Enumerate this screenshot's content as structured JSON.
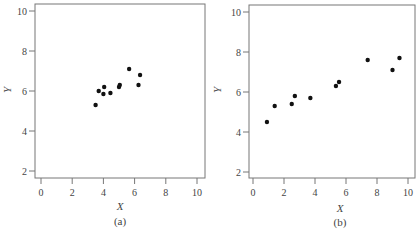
{
  "chart_data": [
    {
      "id": "a",
      "type": "scatter",
      "title": "",
      "caption": "(a)",
      "xlabel": "X",
      "ylabel": "Y",
      "xlim": [
        -0.5,
        10.5
      ],
      "ylim": [
        1.7,
        10.35
      ],
      "xticks": [
        0,
        2,
        4,
        6,
        8,
        10
      ],
      "yticks": [
        2,
        4,
        6,
        8,
        10
      ],
      "grid": false,
      "legend": null,
      "points": [
        {
          "x": 3.5,
          "y": 5.3
        },
        {
          "x": 3.7,
          "y": 6.0
        },
        {
          "x": 4.0,
          "y": 5.85
        },
        {
          "x": 4.05,
          "y": 6.2
        },
        {
          "x": 4.45,
          "y": 5.9
        },
        {
          "x": 5.0,
          "y": 6.2
        },
        {
          "x": 5.05,
          "y": 6.3
        },
        {
          "x": 5.65,
          "y": 7.1
        },
        {
          "x": 6.25,
          "y": 6.3
        },
        {
          "x": 6.35,
          "y": 6.8
        }
      ]
    },
    {
      "id": "b",
      "type": "scatter",
      "title": "",
      "caption": "(b)",
      "xlabel": "X",
      "ylabel": "Y",
      "xlim": [
        -0.4,
        10.45
      ],
      "ylim": [
        1.7,
        10.35
      ],
      "xticks": [
        0,
        2,
        4,
        6,
        8,
        10
      ],
      "yticks": [
        2,
        4,
        6,
        8,
        10
      ],
      "grid": false,
      "legend": null,
      "points": [
        {
          "x": 0.9,
          "y": 4.5
        },
        {
          "x": 1.4,
          "y": 5.3
        },
        {
          "x": 2.5,
          "y": 5.4
        },
        {
          "x": 2.7,
          "y": 5.8
        },
        {
          "x": 3.7,
          "y": 5.7
        },
        {
          "x": 5.35,
          "y": 6.3
        },
        {
          "x": 5.55,
          "y": 6.5
        },
        {
          "x": 7.4,
          "y": 7.6
        },
        {
          "x": 9.0,
          "y": 7.1
        },
        {
          "x": 9.45,
          "y": 7.7
        }
      ]
    }
  ],
  "bottom_text": "……"
}
